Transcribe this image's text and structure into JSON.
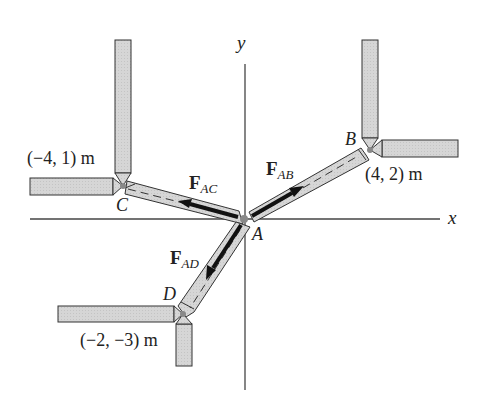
{
  "diagram": {
    "type": "3-member force system (2D truss joint)",
    "axes": {
      "x_label": "x",
      "y_label": "y"
    },
    "origin": {
      "label": "A"
    },
    "points": [
      {
        "id": "B",
        "label": "B",
        "coords": "(4, 2) m"
      },
      {
        "id": "C",
        "label": "C",
        "coords": "(−4, 1) m"
      },
      {
        "id": "D",
        "label": "D",
        "coords": "(−2, −3) m"
      }
    ],
    "forces": [
      {
        "id": "FAB",
        "symbol": "F",
        "subscript": "AB",
        "direction": "A toward B"
      },
      {
        "id": "FAC",
        "symbol": "F",
        "subscript": "AC",
        "direction": "A toward C"
      },
      {
        "id": "FAD",
        "symbol": "F",
        "subscript": "AD",
        "direction": "A toward D"
      }
    ],
    "colors": {
      "member_fill": "#d4d4d4",
      "outline": "#333333",
      "arrow": "#111111",
      "pin": "#888888"
    }
  }
}
